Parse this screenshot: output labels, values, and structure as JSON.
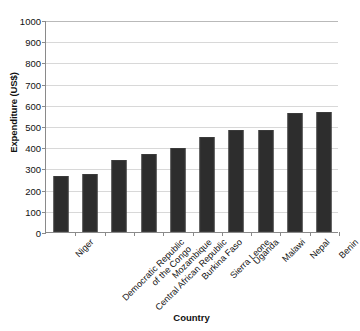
{
  "chart_data": {
    "type": "bar",
    "title": "",
    "xlabel": "Country",
    "ylabel": "Expenditure (US$)",
    "categories": [
      "Niger",
      "Democratic Republic of the Congo",
      "Central African Republic",
      "Mozambique",
      "Burkina Faso",
      "Sierra Leone",
      "Uganda",
      "Malawi",
      "Nepal",
      "Benin"
    ],
    "category_lines": [
      [
        "Niger"
      ],
      [
        "Democratic Republic",
        "of the Congo"
      ],
      [
        "Central African Republic"
      ],
      [
        "Mozambique"
      ],
      [
        "Burkina Faso"
      ],
      [
        "Sierra Leone"
      ],
      [
        "Uganda"
      ],
      [
        "Malawi"
      ],
      [
        "Nepal"
      ],
      [
        "Benin"
      ]
    ],
    "values": [
      265,
      275,
      342,
      370,
      395,
      448,
      480,
      480,
      562,
      565
    ],
    "ylim": [
      0,
      1000
    ],
    "yticks": [
      0,
      100,
      200,
      300,
      400,
      500,
      600,
      700,
      800,
      900,
      1000
    ],
    "ytick_labels": [
      "0",
      "100",
      "200",
      "300",
      "400",
      "500",
      "600",
      "700",
      "800",
      "900",
      "1000"
    ],
    "grid": true,
    "legend": false,
    "bar_color": "#2d2d2d",
    "grid_color": "#d8d8d8",
    "axis_color": "#8a8a8a",
    "background": "#ffffff"
  }
}
